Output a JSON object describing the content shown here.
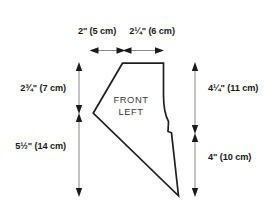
{
  "diagram": {
    "piece_label_line1": "FRONT",
    "piece_label_line2": "LEFT",
    "outline_color": "#231f20",
    "dimension_line_color": "#8a8a8a",
    "text_color": "#1a1a1a",
    "background_color": "#ffffff"
  },
  "dimensions": {
    "top": [
      {
        "id": "top-left-span",
        "label": "2\" (5 cm)",
        "inches": "2\"",
        "metric": "(5 cm)",
        "orientation": "horizontal"
      },
      {
        "id": "top-right-span",
        "label": "2¼\" (6 cm)",
        "inches": "2¼\"",
        "metric": "(6 cm)",
        "orientation": "horizontal"
      }
    ],
    "left": [
      {
        "id": "left-upper-span",
        "label": "2¾\" (7 cm)",
        "inches": "2¾\"",
        "metric": "(7 cm)",
        "orientation": "vertical"
      },
      {
        "id": "left-lower-span",
        "label": "5½\" (14 cm)",
        "inches": "5½\"",
        "metric": "(14 cm)",
        "orientation": "vertical"
      }
    ],
    "right": [
      {
        "id": "right-upper-span",
        "label": "4¼\" (11 cm)",
        "inches": "4¼\"",
        "metric": "(11 cm)",
        "orientation": "vertical"
      },
      {
        "id": "right-lower-span",
        "label": "4\" (10 cm)",
        "inches": "4\"",
        "metric": "(10 cm)",
        "orientation": "vertical"
      }
    ]
  }
}
